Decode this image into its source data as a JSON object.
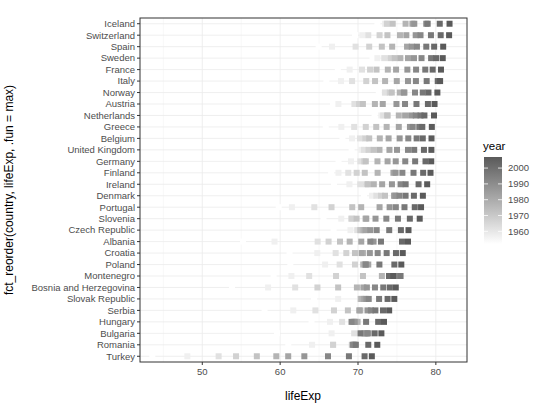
{
  "chart_data": {
    "type": "scatter",
    "title": "",
    "xlabel": "lifeExp",
    "ylabel": "fct_reorder(country, lifeExp, .fun = max)",
    "xlim": [
      42,
      84
    ],
    "x_ticks": [
      50,
      60,
      70,
      80
    ],
    "grid": true,
    "legend": {
      "title": "year",
      "position": "right",
      "type": "colorbar",
      "breaks": [
        2000,
        1990,
        1980,
        1970,
        1960
      ],
      "low_color": "#ffffff",
      "high_color": "#5a5a5a",
      "range": [
        1952,
        2007
      ]
    },
    "years": [
      1952,
      1957,
      1962,
      1967,
      1972,
      1977,
      1982,
      1987,
      1992,
      1997,
      2002,
      2007
    ],
    "countries": [
      "Iceland",
      "Switzerland",
      "Spain",
      "Sweden",
      "France",
      "Italy",
      "Norway",
      "Austria",
      "Netherlands",
      "Greece",
      "Belgium",
      "United Kingdom",
      "Germany",
      "Finland",
      "Ireland",
      "Denmark",
      "Portugal",
      "Slovenia",
      "Czech Republic",
      "Albania",
      "Croatia",
      "Poland",
      "Montenegro",
      "Bosnia and Herzegovina",
      "Slovak Republic",
      "Serbia",
      "Hungary",
      "Bulgaria",
      "Romania",
      "Turkey"
    ],
    "series": [
      {
        "name": "Iceland",
        "values": [
          72.49,
          73.47,
          73.68,
          73.73,
          74.46,
          76.11,
          76.99,
          77.23,
          78.77,
          78.95,
          80.5,
          81.757
        ]
      },
      {
        "name": "Switzerland",
        "values": [
          69.62,
          70.56,
          71.32,
          72.77,
          73.78,
          75.39,
          76.21,
          77.41,
          78.03,
          79.37,
          80.62,
          81.701
        ]
      },
      {
        "name": "Spain",
        "values": [
          64.94,
          66.66,
          69.69,
          71.44,
          73.06,
          74.39,
          76.3,
          76.9,
          77.57,
          78.77,
          79.78,
          80.941
        ]
      },
      {
        "name": "Sweden",
        "values": [
          71.86,
          72.49,
          73.37,
          74.16,
          74.72,
          75.44,
          76.42,
          77.19,
          78.16,
          79.39,
          80.04,
          80.884
        ]
      },
      {
        "name": "France",
        "values": [
          67.41,
          68.93,
          70.51,
          71.55,
          72.38,
          73.83,
          74.89,
          76.34,
          77.46,
          78.64,
          79.59,
          80.657
        ]
      },
      {
        "name": "Italy",
        "values": [
          65.94,
          67.81,
          69.24,
          71.06,
          72.19,
          73.48,
          74.98,
          76.42,
          77.44,
          78.82,
          80.24,
          80.546
        ]
      },
      {
        "name": "Norway",
        "values": [
          72.67,
          73.44,
          73.47,
          74.08,
          74.34,
          75.37,
          75.97,
          75.89,
          77.32,
          78.32,
          79.05,
          80.196
        ]
      },
      {
        "name": "Austria",
        "values": [
          66.8,
          67.48,
          69.54,
          70.14,
          70.63,
          72.17,
          73.18,
          74.94,
          76.04,
          77.51,
          78.98,
          79.829
        ]
      },
      {
        "name": "Netherlands",
        "values": [
          72.13,
          72.99,
          73.23,
          73.82,
          73.75,
          75.24,
          76.05,
          76.83,
          77.42,
          78.03,
          78.53,
          79.762
        ]
      },
      {
        "name": "Greece",
        "values": [
          65.86,
          67.86,
          69.51,
          71.0,
          72.34,
          73.68,
          75.24,
          76.67,
          77.03,
          77.87,
          78.26,
          79.483
        ]
      },
      {
        "name": "Belgium",
        "values": [
          68.0,
          69.24,
          70.25,
          70.94,
          71.44,
          72.8,
          73.93,
          75.35,
          76.46,
          77.53,
          78.32,
          79.441
        ]
      },
      {
        "name": "United Kingdom",
        "values": [
          69.18,
          70.42,
          70.76,
          71.36,
          72.01,
          72.76,
          74.04,
          75.01,
          76.42,
          77.22,
          78.47,
          79.425
        ]
      },
      {
        "name": "Germany",
        "values": [
          67.5,
          69.1,
          70.3,
          70.8,
          71.0,
          72.5,
          73.8,
          74.847,
          76.07,
          77.34,
          78.67,
          79.406
        ]
      },
      {
        "name": "Finland",
        "values": [
          66.55,
          67.49,
          68.75,
          69.83,
          70.87,
          72.52,
          74.55,
          74.83,
          75.7,
          77.13,
          78.37,
          79.313
        ]
      },
      {
        "name": "Ireland",
        "values": [
          66.91,
          68.9,
          70.29,
          71.08,
          71.28,
          72.03,
          73.1,
          74.36,
          75.47,
          76.12,
          77.78,
          78.885
        ]
      },
      {
        "name": "Denmark",
        "values": [
          70.78,
          71.81,
          72.35,
          72.96,
          73.47,
          74.69,
          74.63,
          74.8,
          75.33,
          76.11,
          77.18,
          78.332
        ]
      },
      {
        "name": "Portugal",
        "values": [
          59.82,
          61.51,
          64.39,
          66.6,
          69.26,
          70.41,
          72.77,
          74.06,
          74.86,
          75.97,
          77.29,
          78.098
        ]
      },
      {
        "name": "Slovenia",
        "values": [
          65.57,
          67.85,
          69.15,
          69.18,
          69.82,
          70.97,
          71.063,
          72.25,
          73.64,
          75.13,
          76.66,
          77.926
        ]
      },
      {
        "name": "Czech Republic",
        "values": [
          66.87,
          69.03,
          69.9,
          70.38,
          70.29,
          70.71,
          70.96,
          71.58,
          72.4,
          74.01,
          75.51,
          76.486
        ]
      },
      {
        "name": "Albania",
        "values": [
          55.23,
          59.28,
          64.82,
          66.22,
          67.69,
          68.93,
          70.42,
          72.0,
          71.581,
          72.95,
          75.651,
          76.423
        ]
      },
      {
        "name": "Croatia",
        "values": [
          61.21,
          64.77,
          67.13,
          68.5,
          69.61,
          70.64,
          70.46,
          71.52,
          72.527,
          73.68,
          74.876,
          75.748
        ]
      },
      {
        "name": "Poland",
        "values": [
          61.31,
          65.77,
          67.64,
          69.61,
          70.85,
          70.67,
          71.32,
          70.98,
          70.99,
          72.75,
          74.67,
          75.563
        ]
      },
      {
        "name": "Montenegro",
        "values": [
          59.164,
          61.448,
          63.728,
          67.178,
          70.636,
          73.066,
          74.101,
          74.865,
          75.435,
          75.445,
          73.981,
          74.543
        ]
      },
      {
        "name": "Bosnia and Herzegovina",
        "values": [
          53.82,
          58.45,
          61.93,
          64.79,
          67.45,
          69.86,
          70.69,
          71.14,
          72.178,
          73.244,
          74.09,
          74.852
        ]
      },
      {
        "name": "Slovak Republic",
        "values": [
          64.36,
          67.45,
          70.33,
          70.98,
          70.35,
          70.45,
          70.8,
          71.08,
          71.38,
          72.71,
          73.8,
          74.663
        ]
      },
      {
        "name": "Serbia",
        "values": [
          57.996,
          61.685,
          64.531,
          66.914,
          68.7,
          70.3,
          70.162,
          71.218,
          71.659,
          72.232,
          73.213,
          74.002
        ]
      },
      {
        "name": "Hungary",
        "values": [
          64.03,
          66.41,
          67.96,
          69.5,
          69.76,
          69.95,
          69.39,
          69.58,
          69.17,
          71.04,
          72.59,
          73.338
        ]
      },
      {
        "name": "Bulgaria",
        "values": [
          59.6,
          66.61,
          69.51,
          70.42,
          70.9,
          70.81,
          71.08,
          71.34,
          71.19,
          70.32,
          72.14,
          73.005
        ]
      },
      {
        "name": "Romania",
        "values": [
          61.05,
          64.1,
          66.8,
          66.8,
          69.21,
          69.46,
          69.66,
          69.53,
          69.36,
          69.72,
          71.322,
          72.476
        ]
      },
      {
        "name": "Turkey",
        "values": [
          43.585,
          48.079,
          52.098,
          54.336,
          57.005,
          59.507,
          61.036,
          63.108,
          66.146,
          68.835,
          70.845,
          71.777
        ]
      }
    ]
  }
}
